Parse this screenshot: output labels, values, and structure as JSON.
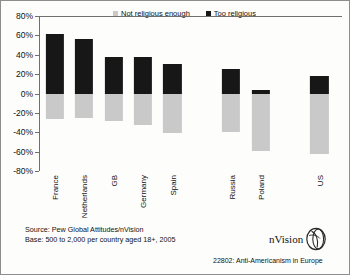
{
  "chart_data": {
    "type": "bar",
    "title": "",
    "subtitle": "",
    "xlabel": "",
    "ylabel": "",
    "ylim": [
      -80,
      80
    ],
    "ytick_step": 20,
    "ytick_labels": [
      "80%",
      "60%",
      "40%",
      "20%",
      "0%",
      "-20%",
      "-40%",
      "-60%",
      "-80%"
    ],
    "ytick_values": [
      80,
      60,
      40,
      20,
      0,
      -20,
      -40,
      -60,
      -80
    ],
    "grid": false,
    "legend_position": "top",
    "categories": [
      "France",
      "Netherlands",
      "GB",
      "Germany",
      "Spain",
      "",
      "Russia",
      "Poland",
      "",
      "US"
    ],
    "series": [
      {
        "name": "Too religious",
        "color": "#171717",
        "values": [
          61,
          56,
          38,
          38,
          30,
          null,
          25,
          4,
          null,
          18
        ]
      },
      {
        "name": "Not religious enough",
        "color": "#c9c9c9",
        "values": [
          -26,
          -25,
          -28,
          -32,
          -41,
          null,
          -40,
          -59,
          null,
          -62
        ]
      }
    ]
  },
  "legend": {
    "items": [
      {
        "label": "Not religious enough",
        "color": "#c9c9c9"
      },
      {
        "label": "Too religious",
        "color": "#171717"
      }
    ]
  },
  "footer": {
    "source": "Source: Pew Global Attitudes/nVision",
    "base": "Base: 500 to 2,000 per country aged 18+, 2005",
    "caption": "22802: Anti-Americanism in Europe",
    "logo_text": "nVision"
  }
}
